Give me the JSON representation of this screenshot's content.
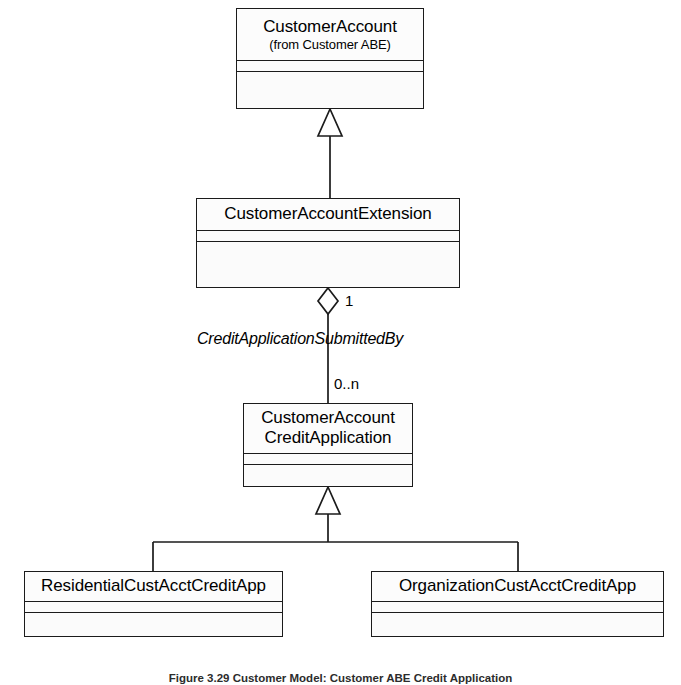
{
  "figure": {
    "caption": "Figure 3.29  Customer Model: Customer ABE Credit Application",
    "diagram_type": "UML Class Diagram",
    "background_color": "#ffffff",
    "line_color": "#1b1b1b"
  },
  "classes": [
    {
      "id": "customer-account",
      "name": "CustomerAccount",
      "stereotype": "(from Customer ABE)",
      "x": 236,
      "y": 8,
      "width": 188,
      "height": 101
    },
    {
      "id": "customer-account-extension",
      "name": "CustomerAccountExtension",
      "stereotype": "",
      "x": 196,
      "y": 198,
      "width": 264,
      "height": 90
    },
    {
      "id": "customer-account-credit-application",
      "name": "CustomerAccount\nCreditApplication",
      "stereotype": "",
      "x": 243,
      "y": 403,
      "width": 170,
      "height": 84
    },
    {
      "id": "residential-cust-acct-credit-app",
      "name": "ResidentialCustAcctCreditApp",
      "stereotype": "",
      "x": 24,
      "y": 571,
      "width": 259,
      "height": 66
    },
    {
      "id": "organization-cust-acct-credit-app",
      "name": "OrganizationCustAcctCreditApp",
      "stereotype": "",
      "x": 371,
      "y": 571,
      "width": 293,
      "height": 66
    }
  ],
  "relationships": [
    {
      "id": "generalization-extension-to-account",
      "type": "generalization",
      "from": "customer-account-extension",
      "to": "customer-account",
      "label": ""
    },
    {
      "id": "aggregation-credit-application-submitted-by",
      "type": "aggregation",
      "from": "customer-account-extension",
      "to": "customer-account-credit-application",
      "label": "CreditApplicationSubmittedBy",
      "source_multiplicity": "1",
      "target_multiplicity": "0..n"
    },
    {
      "id": "generalization-residential-to-credit-application",
      "type": "generalization",
      "from": "residential-cust-acct-credit-app",
      "to": "customer-account-credit-application",
      "label": ""
    },
    {
      "id": "generalization-organization-to-credit-application",
      "type": "generalization",
      "from": "organization-cust-acct-credit-app",
      "to": "customer-account-credit-application",
      "label": ""
    }
  ],
  "labels": {
    "association_name": "CreditApplicationSubmittedBy",
    "multiplicity_one": "1",
    "multiplicity_zero_to_n": "0..n"
  }
}
